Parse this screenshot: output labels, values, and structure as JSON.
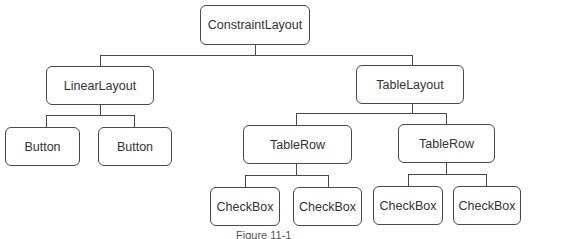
{
  "diagram": {
    "type": "tree",
    "nodes": {
      "root": {
        "label": "ConstraintLayout"
      },
      "linear_layout": {
        "label": "LinearLayout"
      },
      "table_layout": {
        "label": "TableLayout"
      },
      "button_1": {
        "label": "Button"
      },
      "button_2": {
        "label": "Button"
      },
      "table_row_1": {
        "label": "TableRow"
      },
      "table_row_2": {
        "label": "TableRow"
      },
      "checkbox_1": {
        "label": "CheckBox"
      },
      "checkbox_2": {
        "label": "CheckBox"
      },
      "checkbox_3": {
        "label": "CheckBox"
      },
      "checkbox_4": {
        "label": "CheckBox"
      }
    },
    "edges": [
      [
        "root",
        "linear_layout"
      ],
      [
        "root",
        "table_layout"
      ],
      [
        "linear_layout",
        "button_1"
      ],
      [
        "linear_layout",
        "button_2"
      ],
      [
        "table_layout",
        "table_row_1"
      ],
      [
        "table_layout",
        "table_row_2"
      ],
      [
        "table_row_1",
        "checkbox_1"
      ],
      [
        "table_row_1",
        "checkbox_2"
      ],
      [
        "table_row_2",
        "checkbox_3"
      ],
      [
        "table_row_2",
        "checkbox_4"
      ]
    ],
    "caption": "Figure 11-1"
  }
}
